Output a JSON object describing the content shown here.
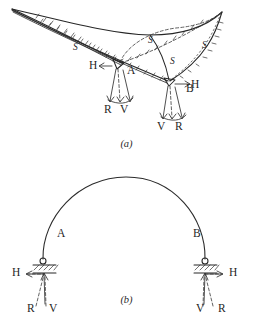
{
  "figure": {
    "panels": [
      {
        "id": "a",
        "caption": "(a)",
        "description": "Funicular / force diagram with cusped curved triangle",
        "point_labels": [
          {
            "name": "A",
            "text": "A"
          },
          {
            "name": "B",
            "text": "B"
          }
        ],
        "member_force_labels": [
          {
            "name": "s-left-chord",
            "text": "S"
          },
          {
            "name": "s-upper-middle",
            "text": "S"
          },
          {
            "name": "s-lower-middle",
            "text": "S"
          },
          {
            "name": "s-right",
            "text": "S"
          }
        ],
        "reaction_labels": [
          {
            "name": "h-left",
            "text": "H"
          },
          {
            "name": "r-left",
            "text": "R"
          },
          {
            "name": "v-left",
            "text": "V"
          },
          {
            "name": "h-right",
            "text": "H"
          },
          {
            "name": "v-right",
            "text": "V"
          },
          {
            "name": "r-right",
            "text": "R"
          }
        ]
      },
      {
        "id": "b",
        "caption": "(b)",
        "description": "Two-hinged arch on pinned supports",
        "point_labels": [
          {
            "name": "A",
            "text": "A"
          },
          {
            "name": "B",
            "text": "B"
          }
        ],
        "reaction_labels": [
          {
            "name": "h-left",
            "text": "H"
          },
          {
            "name": "r-left",
            "text": "R"
          },
          {
            "name": "v-left",
            "text": "V"
          },
          {
            "name": "h-right",
            "text": "H"
          },
          {
            "name": "v-right",
            "text": "V"
          },
          {
            "name": "r-right",
            "text": "R"
          }
        ]
      }
    ],
    "colors": {
      "ink": "#262626",
      "dashed": "#3a3a3a",
      "background": "#ffffff"
    }
  }
}
